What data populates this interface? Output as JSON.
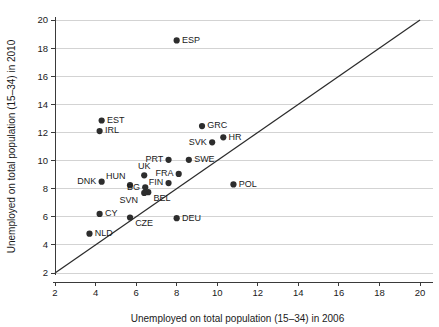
{
  "chart_data": {
    "type": "scatter",
    "title": "",
    "xlabel": "Unemployed on total population (15–34) in 2006",
    "ylabel": "Unemployed on total population (15–34) in 2010",
    "xlim": [
      2,
      20
    ],
    "ylim": [
      2,
      20
    ],
    "xticks": [
      2,
      4,
      6,
      8,
      10,
      12,
      14,
      16,
      18,
      20
    ],
    "yticks": [
      2,
      4,
      6,
      8,
      10,
      12,
      14,
      16,
      18,
      20
    ],
    "xtick_labels": [
      "2",
      "4",
      "6",
      "8",
      "10",
      "12",
      "14",
      "16",
      "18",
      "20"
    ],
    "ytick_labels": [
      "2",
      "4",
      "6",
      "8",
      "10",
      "12",
      "14",
      "16",
      "18",
      "20"
    ],
    "grid": "horizontal",
    "legend": "none",
    "reference_line": {
      "name": "45-degree-identity-line",
      "from": [
        2,
        2
      ],
      "to": [
        20,
        20
      ]
    },
    "marker_color": "#2d2d2d",
    "grid_color": "#c8c8c8",
    "axis_color": "#3a3a3a",
    "points": [
      {
        "label": "ESP",
        "x": 8.0,
        "y": 18.55,
        "label_pos": "right"
      },
      {
        "label": "EST",
        "x": 4.3,
        "y": 12.85,
        "label_pos": "right"
      },
      {
        "label": "IRL",
        "x": 4.2,
        "y": 12.1,
        "label_pos": "right"
      },
      {
        "label": "GRC",
        "x": 9.25,
        "y": 12.45,
        "label_pos": "right"
      },
      {
        "label": "HR",
        "x": 10.3,
        "y": 11.65,
        "label_pos": "right"
      },
      {
        "label": "SVK",
        "x": 9.75,
        "y": 11.3,
        "label_pos": "left"
      },
      {
        "label": "PRT",
        "x": 7.6,
        "y": 10.05,
        "label_pos": "left"
      },
      {
        "label": "SWE",
        "x": 8.6,
        "y": 10.05,
        "label_pos": "right"
      },
      {
        "label": "FRA",
        "x": 8.1,
        "y": 9.05,
        "label_pos": "left"
      },
      {
        "label": "UK",
        "x": 6.4,
        "y": 8.95,
        "label_pos": "above"
      },
      {
        "label": "HUN",
        "x": 5.7,
        "y": 8.25,
        "label_pos": "above-right"
      },
      {
        "label": "DNK",
        "x": 4.3,
        "y": 8.5,
        "label_pos": "left"
      },
      {
        "label": "FIN",
        "x": 7.6,
        "y": 8.4,
        "label_pos": "left"
      },
      {
        "label": "BG",
        "x": 6.45,
        "y": 8.1,
        "label_pos": "left"
      },
      {
        "label": "POL",
        "x": 10.8,
        "y": 8.3,
        "label_pos": "right"
      },
      {
        "label": "BEL",
        "x": 6.6,
        "y": 7.75,
        "label_pos": "right-below"
      },
      {
        "label": "SVN",
        "x": 6.4,
        "y": 7.7,
        "label_pos": "left-below"
      },
      {
        "label": "CY",
        "x": 4.2,
        "y": 6.2,
        "label_pos": "right"
      },
      {
        "label": "CZE",
        "x": 5.7,
        "y": 5.95,
        "label_pos": "right-below"
      },
      {
        "label": "DEU",
        "x": 8.0,
        "y": 5.9,
        "label_pos": "right"
      },
      {
        "label": "NLD",
        "x": 3.7,
        "y": 4.8,
        "label_pos": "right"
      }
    ]
  }
}
